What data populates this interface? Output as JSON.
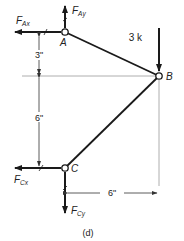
{
  "diagram": {
    "caption": "(d)",
    "joints": {
      "A": {
        "label": "A"
      },
      "B": {
        "label": "B"
      },
      "C": {
        "label": "C"
      }
    },
    "forces": {
      "FAx": {
        "main": "F",
        "sub": "Ax"
      },
      "FAy": {
        "main": "F",
        "sub": "Ay"
      },
      "FCx": {
        "main": "F",
        "sub": "Cx"
      },
      "FCy": {
        "main": "F",
        "sub": "Cy"
      },
      "load": {
        "label": "3 k"
      }
    },
    "dimensions": {
      "top_vertical": "3\"",
      "bottom_vertical": "6\"",
      "horizontal": "6\""
    },
    "colors": {
      "line": "#1a1a1a",
      "reference": "#9a9a9a"
    }
  }
}
